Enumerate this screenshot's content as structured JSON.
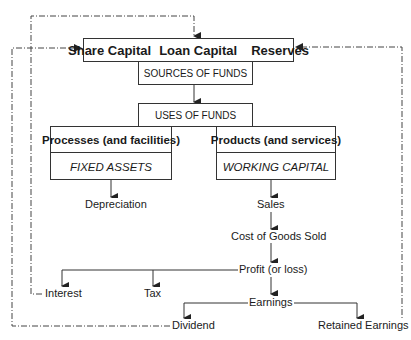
{
  "diagram": {
    "type": "flowchart",
    "title": "",
    "top_box": {
      "items": [
        "Share Capital",
        "Loan Capital",
        "Reserves"
      ]
    },
    "sources_label": "SOURCES OF FUNDS",
    "uses_label": "USES OF FUNDS",
    "left_branch": {
      "heading": "Processes (and facilities)",
      "subheading": "FIXED ASSETS",
      "output": "Depreciation"
    },
    "right_branch": {
      "heading": "Products (and services)",
      "subheading": "WORKING CAPITAL",
      "chain": [
        "Sales",
        "Cost of Goods Sold",
        "Profit (or loss)",
        "Earnings"
      ]
    },
    "profit_outputs": [
      "Interest",
      "Tax"
    ],
    "earnings_outputs": [
      "Dividend",
      "Retained Earnings"
    ],
    "feedback_loops": [
      {
        "from": "Interest",
        "to": "Share Capital Loan Capital Reserves (top)",
        "style": "dash-dot"
      },
      {
        "from": "Dividend",
        "to": "Share Capital Loan Capital Reserves (left)",
        "style": "dash-dot"
      },
      {
        "from": "Retained Earnings",
        "to": "Share Capital Loan Capital Reserves (right)",
        "style": "dash-dot"
      }
    ],
    "colors": {
      "line": "#333333",
      "background": "#ffffff",
      "text": "#1a1a1a"
    }
  }
}
